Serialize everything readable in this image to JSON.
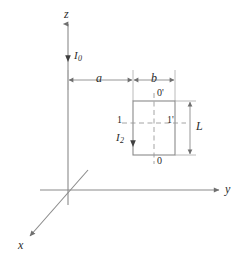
{
  "figure": {
    "background_color": "#ffffff",
    "stroke_color": "#8a8a8a",
    "dash_color": "#9a9a9a",
    "text_color": "#2b2b2b",
    "axes": {
      "z": {
        "label": "z",
        "orientation": "vertical-up"
      },
      "y": {
        "label": "y",
        "orientation": "horizontal-right"
      },
      "x": {
        "label": "x",
        "orientation": "diagonal-down-left"
      }
    },
    "currents": {
      "wire": {
        "label": "I",
        "subscript": "0",
        "direction": "up"
      },
      "loop": {
        "label": "I",
        "subscript": "2",
        "direction": "up"
      }
    },
    "dimensions": {
      "a": {
        "label": "a",
        "from": "z-axis",
        "to": "loop-near-side"
      },
      "b": {
        "label": "b",
        "from": "loop-near-side",
        "to": "loop-far-side"
      },
      "L": {
        "label": "L",
        "orientation": "vertical",
        "spans": "loop-height"
      }
    },
    "loop_nodes": {
      "top": "0'",
      "bottom": "0",
      "left": "1",
      "right": "1'"
    }
  }
}
